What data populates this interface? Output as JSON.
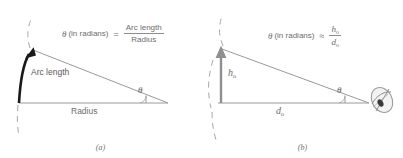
{
  "figure": {
    "panels": [
      {
        "id": "a",
        "caption": "(a)",
        "formula": {
          "variable": "θ",
          "qualifier": "(in radians)",
          "relation": "=",
          "numerator": "Arc length",
          "denominator": "Radius"
        },
        "labels": {
          "arc": "Arc length",
          "base": "Radius",
          "angle": "θ"
        },
        "icons": {
          "arc_arrow": "arc-arrow-icon",
          "dashed_arc": "dashed-arc-icon"
        },
        "colors": {
          "arc": "#1a1a1a",
          "lines": "#9a9a9a",
          "dashed": "#a8a8a8",
          "text": "#6e6e6e"
        }
      },
      {
        "id": "b",
        "caption": "(b)",
        "formula": {
          "variable": "θ",
          "qualifier": "(in radians)",
          "relation": "≈",
          "numerator_base": "h",
          "numerator_sub": "o",
          "denominator_base": "d",
          "denominator_sub": "o"
        },
        "labels": {
          "height_base": "h",
          "height_sub": "o",
          "distance_base": "d",
          "distance_sub": "o",
          "angle": "θ"
        },
        "icons": {
          "height_arrow": "height-arrow-icon",
          "dashed_arc": "dashed-arc-icon",
          "observer": "eye-icon"
        },
        "colors": {
          "arrow": "#8f8f8f",
          "lines": "#9a9a9a",
          "dashed": "#a8a8a8",
          "text": "#6e6e6e"
        }
      }
    ]
  }
}
